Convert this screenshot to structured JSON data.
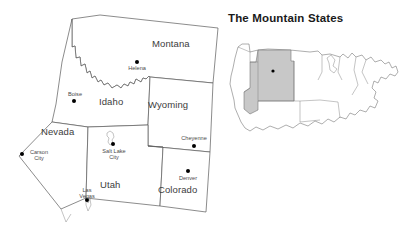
{
  "figure": {
    "title": "The Mountain States",
    "type": "thematic-map",
    "background_color": "#ffffff",
    "line_color": "#5a5a5a",
    "label_color": "#3c3c3c",
    "highlight_color": "#c8c8c8"
  },
  "main_map": {
    "name": "mountain-states-map",
    "states": [
      {
        "id": "montana",
        "label": "Montana",
        "label_x": 152,
        "label_y": 44,
        "capital": {
          "name": "Helena",
          "lines": [
            "Helena"
          ],
          "dot_x": 137,
          "dot_y": 62,
          "label_x": 137,
          "label_y": 66
        }
      },
      {
        "id": "idaho",
        "label": "Idaho",
        "label_x": 112,
        "label_y": 101,
        "capital": {
          "name": "Boise",
          "lines": [
            "Boise"
          ],
          "dot_x": 74,
          "dot_y": 101,
          "label_x": 76,
          "label_y": 93
        }
      },
      {
        "id": "wyoming",
        "label": "Wyoming",
        "label_x": 168,
        "label_y": 105,
        "capital": {
          "name": "Cheyenne",
          "lines": [
            "Cheyenne"
          ],
          "dot_x": 194,
          "dot_y": 146,
          "label_x": 186,
          "label_y": 137
        }
      },
      {
        "id": "nevada",
        "label": "Nevada",
        "label_x": 57,
        "label_y": 132,
        "capital": {
          "name": "Carson City",
          "lines": [
            "Carson",
            "City"
          ],
          "dot_x": 22,
          "dot_y": 154,
          "label_x": 37,
          "label_y": 149
        }
      },
      {
        "id": "utah",
        "label": "Utah",
        "label_x": 111,
        "label_y": 185,
        "capital": {
          "name": "Salt Lake City",
          "lines": [
            "Salt Lake",
            "City"
          ],
          "dot_x": 113,
          "dot_y": 144,
          "label_x": 113,
          "label_y": 147
        }
      },
      {
        "id": "colorado",
        "label": "Colorado",
        "label_x": 178,
        "label_y": 190,
        "capital": {
          "name": "Denver",
          "lines": [
            "Denver"
          ],
          "dot_x": 188,
          "dot_y": 171,
          "label_x": 188,
          "label_y": 175
        }
      }
    ],
    "extra_cities": [
      {
        "name": "Las Vegas",
        "state": "nevada",
        "lines": [
          "Las",
          "Vegas"
        ],
        "dot_x": 87,
        "dot_y": 200,
        "label_x": 85,
        "label_y": 188
      }
    ]
  },
  "inset_map": {
    "name": "usa-locator-inset",
    "description": "United States outline with the mountain states region shaded",
    "highlight_color": "#c8c8c8",
    "outline_color": "#6a6a6a"
  }
}
